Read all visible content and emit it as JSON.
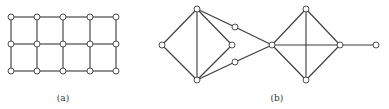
{
  "figures": [
    {
      "id": "a",
      "label": "(a)",
      "label_pos": [
        63,
        101
      ],
      "nodes": [
        [
          11,
          17
        ],
        [
          37,
          17
        ],
        [
          63,
          17
        ],
        [
          90,
          17
        ],
        [
          116,
          17
        ],
        [
          11,
          44
        ],
        [
          37,
          44
        ],
        [
          63,
          44
        ],
        [
          90,
          44
        ],
        [
          116,
          44
        ],
        [
          11,
          71
        ],
        [
          37,
          71
        ],
        [
          63,
          71
        ],
        [
          90,
          71
        ],
        [
          116,
          71
        ]
      ],
      "edges": [
        [
          0,
          1
        ],
        [
          1,
          2
        ],
        [
          2,
          3
        ],
        [
          3,
          4
        ],
        [
          5,
          6
        ],
        [
          6,
          7
        ],
        [
          7,
          8
        ],
        [
          8,
          9
        ],
        [
          10,
          11
        ],
        [
          11,
          12
        ],
        [
          12,
          13
        ],
        [
          13,
          14
        ],
        [
          0,
          5
        ],
        [
          5,
          10
        ],
        [
          1,
          6
        ],
        [
          6,
          11
        ],
        [
          2,
          7
        ],
        [
          7,
          12
        ],
        [
          3,
          8
        ],
        [
          8,
          13
        ],
        [
          4,
          9
        ],
        [
          9,
          14
        ]
      ]
    },
    {
      "id": "b",
      "label": "(b)",
      "label_pos": [
        277,
        101
      ],
      "nodes": [
        [
          197,
          9
        ],
        [
          162,
          45
        ],
        [
          232,
          45
        ],
        [
          197,
          80
        ],
        [
          235,
          27
        ],
        [
          235,
          62
        ],
        [
          272,
          45
        ],
        [
          306,
          9
        ],
        [
          306,
          80
        ],
        [
          340,
          45
        ],
        [
          376,
          45
        ]
      ],
      "edges": [
        [
          0,
          1
        ],
        [
          0,
          2
        ],
        [
          0,
          3
        ],
        [
          1,
          3
        ],
        [
          2,
          3
        ],
        [
          0,
          4
        ],
        [
          4,
          6
        ],
        [
          3,
          5
        ],
        [
          5,
          6
        ],
        [
          6,
          7
        ],
        [
          6,
          8
        ],
        [
          6,
          9
        ],
        [
          7,
          8
        ],
        [
          7,
          9
        ],
        [
          8,
          9
        ],
        [
          9,
          10
        ]
      ]
    }
  ],
  "colors": {
    "stroke": "#3a3a3a",
    "node_fill": "#ffffff",
    "label": "#333333"
  },
  "node_radius": 3
}
